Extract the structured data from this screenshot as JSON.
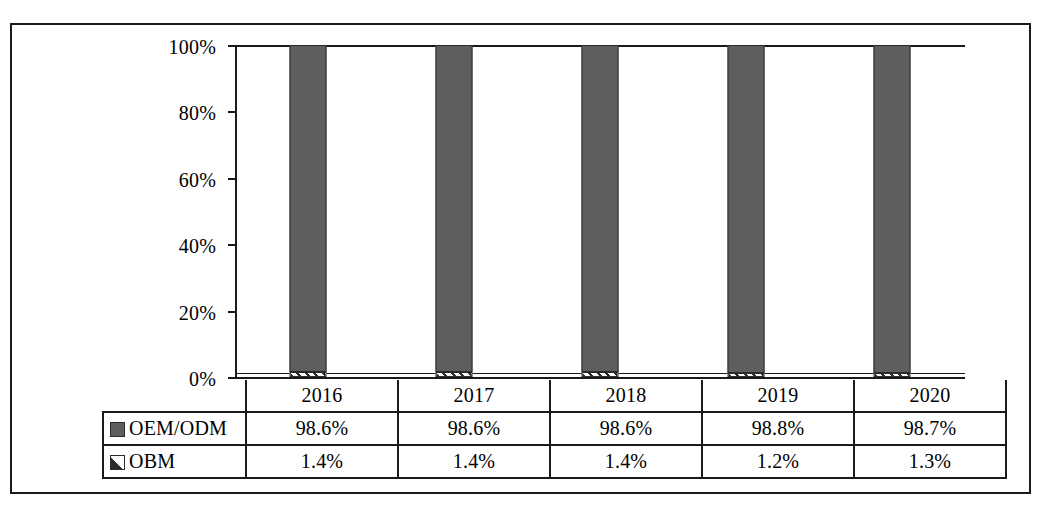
{
  "chart_data": {
    "type": "bar",
    "stacked": true,
    "percent_stacked": true,
    "title": "",
    "subtitle": "",
    "xlabel": "",
    "ylabel": "",
    "categories": [
      "2016",
      "2017",
      "2018",
      "2019",
      "2020"
    ],
    "series": [
      {
        "name": "OEM/ODM",
        "swatch": "filled-gray-square",
        "color": "#5e5e5e",
        "values": [
          98.6,
          98.6,
          98.6,
          98.8,
          98.7
        ],
        "labels": [
          "98.6%",
          "98.6%",
          "98.6%",
          "98.8%",
          "98.7%"
        ]
      },
      {
        "name": "OBM",
        "swatch": "hatched-white-square",
        "color": "#ffffff",
        "values": [
          1.4,
          1.4,
          1.4,
          1.2,
          1.3
        ],
        "labels": [
          "1.4%",
          "1.4%",
          "1.4%",
          "1.2%",
          "1.3%"
        ]
      }
    ],
    "ylim": [
      0,
      100
    ],
    "y_ticks": [
      0,
      20,
      40,
      60,
      80,
      100
    ],
    "y_tick_labels": [
      "0%",
      "20%",
      "40%",
      "60%",
      "80%",
      "100%"
    ],
    "grid": false,
    "legend_position": "data-table-left-column",
    "data_table_visible": true
  },
  "axis": {
    "y_tick_labels": [
      "100%",
      "80%",
      "60%",
      "40%",
      "20%",
      "0%"
    ]
  },
  "table": {
    "year_headers": [
      "2016",
      "2017",
      "2018",
      "2019",
      "2020"
    ],
    "rows": [
      {
        "legend_label": "OEM/ODM",
        "values": [
          "98.6%",
          "98.6%",
          "98.6%",
          "98.8%",
          "98.7%"
        ]
      },
      {
        "legend_label": "OBM",
        "values": [
          "1.4%",
          "1.4%",
          "1.4%",
          "1.2%",
          "1.3%"
        ]
      }
    ]
  },
  "colors": {
    "oem_fill": "#5e5e5e",
    "obm_fill": "#ffffff",
    "line": "#1a1a1a",
    "background": "#ffffff"
  }
}
